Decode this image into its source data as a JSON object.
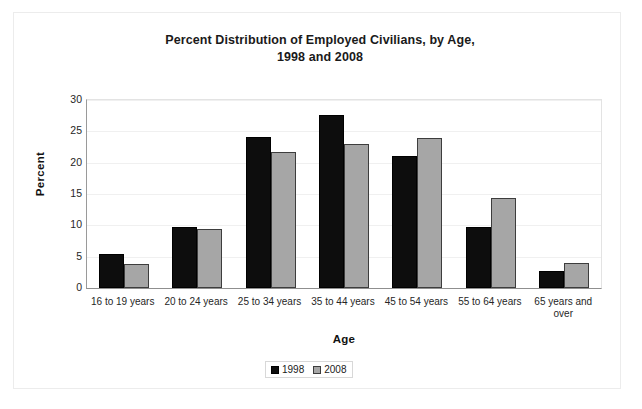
{
  "chart_data": {
    "type": "bar",
    "title": "Percent Distribution of Employed Civilians, by Age,\n1998 and 2008",
    "title_line1": "Percent Distribution of Employed Civilians, by Age,",
    "title_line2": "1998 and 2008",
    "xlabel": "Age",
    "ylabel": "Percent",
    "ylim": [
      0,
      30
    ],
    "yticks": [
      0,
      5,
      10,
      15,
      20,
      25,
      30
    ],
    "ytick_labels": [
      "0",
      "5",
      "10",
      "15",
      "20",
      "25",
      "30"
    ],
    "grid": true,
    "legend_position": "bottom-center",
    "categories": [
      "16 to 19 years",
      "20 to 24 years",
      "25 to 34 years",
      "35 to 44 years",
      "45 to 54 years",
      "55 to 64 years",
      "65 years and over"
    ],
    "series": [
      {
        "name": "1998",
        "color": "#0d0d0d",
        "values": [
          5.4,
          9.7,
          24.1,
          27.6,
          21.0,
          9.8,
          2.7
        ]
      },
      {
        "name": "2008",
        "color": "#a6a6a6",
        "values": [
          3.8,
          9.4,
          21.7,
          23.0,
          23.9,
          14.3,
          4.0
        ]
      }
    ]
  },
  "legend": {
    "items": [
      {
        "label": "1998"
      },
      {
        "label": "2008"
      }
    ]
  }
}
